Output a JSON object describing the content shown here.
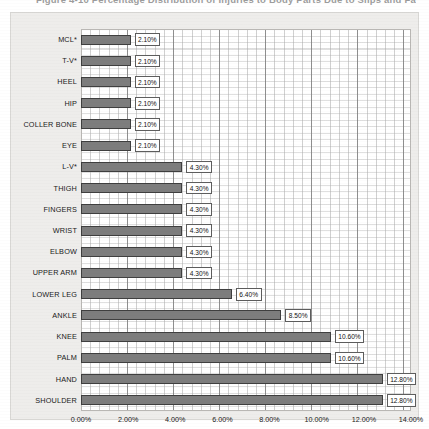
{
  "figure": {
    "caption": "Figure 4-10  Percentage Distribution of Injuries to Body Parts Due to Slips and Falls"
  },
  "chart_data": {
    "type": "bar",
    "orientation": "horizontal",
    "title": "",
    "xlabel": "",
    "ylabel": "",
    "xlim": [
      0,
      14
    ],
    "xticks": [
      "0.00%",
      "2.00%",
      "4.00%",
      "6.00%",
      "8.00%",
      "10.00%",
      "12.00%",
      "14.00%"
    ],
    "xtick_values": [
      0,
      2,
      4,
      6,
      8,
      10,
      12,
      14
    ],
    "grid": true,
    "legend": "none",
    "value_suffix": "%",
    "categories": [
      "MCL*",
      "T-V*",
      "HEEL",
      "HIP",
      "COLLER BONE",
      "EYE",
      "L-V*",
      "THIGH",
      "FINGERS",
      "WRIST",
      "ELBOW",
      "UPPER ARM",
      "LOWER LEG",
      "ANKLE",
      "KNEE",
      "PALM",
      "HAND",
      "SHOULDER"
    ],
    "values": [
      2.1,
      2.1,
      2.1,
      2.1,
      2.1,
      2.1,
      4.3,
      4.3,
      4.3,
      4.3,
      4.3,
      4.3,
      6.4,
      8.5,
      10.6,
      10.6,
      12.8,
      12.8
    ],
    "labels": [
      "2.10%",
      "2.10%",
      "2.10%",
      "2.10%",
      "2.10%",
      "2.10%",
      "4.30%",
      "4.30%",
      "4.30%",
      "4.30%",
      "4.30%",
      "4.30%",
      "6.40%",
      "8.50%",
      "10.60%",
      "10.60%",
      "12.80%",
      "12.80%"
    ],
    "colors": {
      "bar_fill": "#7d7d7d",
      "bar_border": "#3f3f3f",
      "plot_background": "#ffffff",
      "chart_background": "#eeedeb",
      "gridline": "#aaaaaa",
      "text": "#1a1a1a"
    }
  }
}
